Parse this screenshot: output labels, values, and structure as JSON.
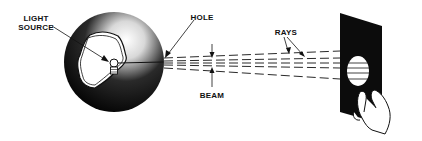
{
  "diagram": {
    "labels": {
      "light_source_line1": "LIGHT",
      "light_source_line2": "SOURCE",
      "hole": "HOLE",
      "beam": "BEAM",
      "rays": "RAYS"
    },
    "colors": {
      "ink": "#111111",
      "paper": "#ffffff"
    }
  }
}
